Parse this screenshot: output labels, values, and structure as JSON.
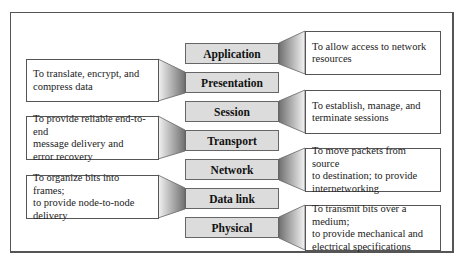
{
  "diagram": {
    "layers": [
      {
        "name": "Application",
        "side": "right",
        "description": "To allow access to network resources",
        "desc_lines": [
          "To allow access to network",
          "resources"
        ]
      },
      {
        "name": "Presentation",
        "side": "left",
        "description": "To translate, encrypt, and compress data",
        "desc_lines": [
          "To translate, encrypt, and",
          "compress data"
        ]
      },
      {
        "name": "Session",
        "side": "right",
        "description": "To establish, manage, and terminate sessions",
        "desc_lines": [
          "To establish, manage, and",
          "terminate sessions"
        ]
      },
      {
        "name": "Transport",
        "side": "left",
        "description": "To provide reliable end-to-end message delivery and error recovery",
        "desc_lines": [
          "To provide reliable end-to-end",
          "message delivery and",
          "error recovery"
        ]
      },
      {
        "name": "Network",
        "side": "right",
        "description": "To move packets from source to destination; to provide internetworking",
        "desc_lines": [
          "To move packets from source",
          "to destination; to provide",
          "internetworking"
        ]
      },
      {
        "name": "Data link",
        "side": "left",
        "description": "To organize bits into frames; to provide node-to-node delivery",
        "desc_lines": [
          "To organize bits into frames;",
          "to provide node-to-node",
          "delivery"
        ]
      },
      {
        "name": "Physical",
        "side": "right",
        "description": "To transmit bits over a medium; to provide mechanical and electrical specifications",
        "desc_lines": [
          "To transmit bits over a medium;",
          "to provide mechanical and",
          "electrical specifications"
        ]
      }
    ]
  },
  "colors": {
    "layer_fill": "#dcdcdc",
    "border": "#555555",
    "connector_dark": "#777777",
    "connector_light": "#f2f2f2"
  }
}
